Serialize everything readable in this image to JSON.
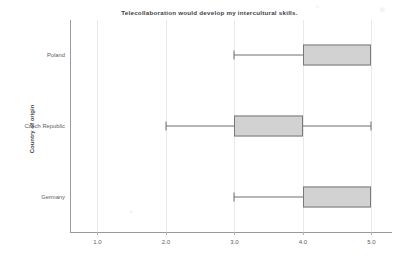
{
  "chart_data": {
    "type": "box",
    "title": "Telecollaboration would develop my intercultural skills.",
    "xlabel": "",
    "ylabel": "Country of origin",
    "orientation": "horizontal",
    "xlim": [
      0.6,
      5.3
    ],
    "xticks": [
      "1.0",
      "2.0",
      "3.0",
      "4.0",
      "5.0"
    ],
    "xtick_values": [
      1.0,
      2.0,
      3.0,
      4.0,
      5.0
    ],
    "grid": true,
    "legend": "none",
    "categories": [
      "Poland",
      "Czech Republic",
      "Germany"
    ],
    "boxes": [
      {
        "category": "Poland",
        "whisker_low": 3.0,
        "q1": 4.0,
        "median": 5.0,
        "q3": 5.0,
        "whisker_high": 5.0,
        "fill_color": "#d2d2d2",
        "line_color": "#77787b"
      },
      {
        "category": "Czech Republic",
        "whisker_low": 2.0,
        "q1": 3.0,
        "median": 4.0,
        "q3": 4.0,
        "whisker_high": 5.0,
        "fill_color": "#d2d2d2",
        "line_color": "#77787b"
      },
      {
        "category": "Germany",
        "whisker_low": 3.0,
        "q1": 4.0,
        "median": 5.0,
        "q3": 5.0,
        "whisker_high": 5.0,
        "fill_color": "#d2d2d2",
        "line_color": "#77787b"
      }
    ]
  },
  "style": {
    "background": "#ffffff",
    "axis_color": "#9a9a9c",
    "grid_color": "#e9e9ea",
    "text_color": "#5b5c60",
    "title_color": "#3f4044"
  }
}
